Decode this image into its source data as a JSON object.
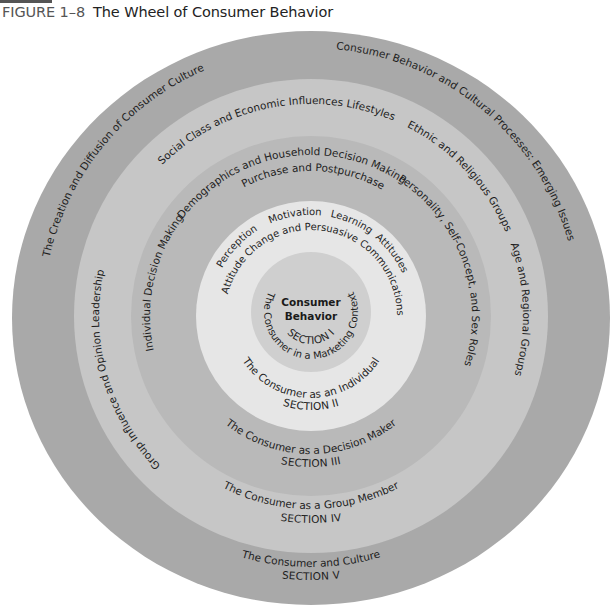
{
  "figure": {
    "number": "FIGURE 1–8",
    "title": "The Wheel of Consumer Behavior"
  },
  "colors": {
    "ring5": "#a9a9a9",
    "ring4": "#c6c6c6",
    "ring3": "#b9b9b9",
    "ring2": "#e6e6e6",
    "core": "#cfcfcf",
    "text": "#1e1e1e"
  },
  "core": {
    "title_line1": "Consumer",
    "title_line2": "Behavior"
  },
  "sections": [
    {
      "label": "SECTION I",
      "subtitle": "The Consumer in a Marketing Context",
      "topics": []
    },
    {
      "label": "SECTION II",
      "subtitle": "The Consumer as an Individual",
      "topics": [
        "Perception",
        "Motivation",
        "Learning",
        "Attitudes",
        "Attitude Change and Persuasive Communications"
      ]
    },
    {
      "label": "SECTION III",
      "subtitle": "The Consumer as a Decision Maker",
      "topics": [
        "Individual Decision Making",
        "Demographics and Household Decision Making",
        "Purchase and Postpurchase",
        "Personality, Self-Concept, and Sex Roles"
      ]
    },
    {
      "label": "SECTION IV",
      "subtitle": "The Consumer as a Group Member",
      "topics": [
        "Group Influence and Opinion Leadership",
        "Social Class and Economic Influences",
        "Lifestyles",
        "Ethnic and Religious Groups",
        "Age and Regional Groups"
      ]
    },
    {
      "label": "SECTION V",
      "subtitle": "The Consumer and Culture",
      "topics": [
        "The Creation and Diffusion of Consumer Culture",
        "Consumer Behavior and Cultural Processes: Emerging Issues"
      ]
    }
  ]
}
